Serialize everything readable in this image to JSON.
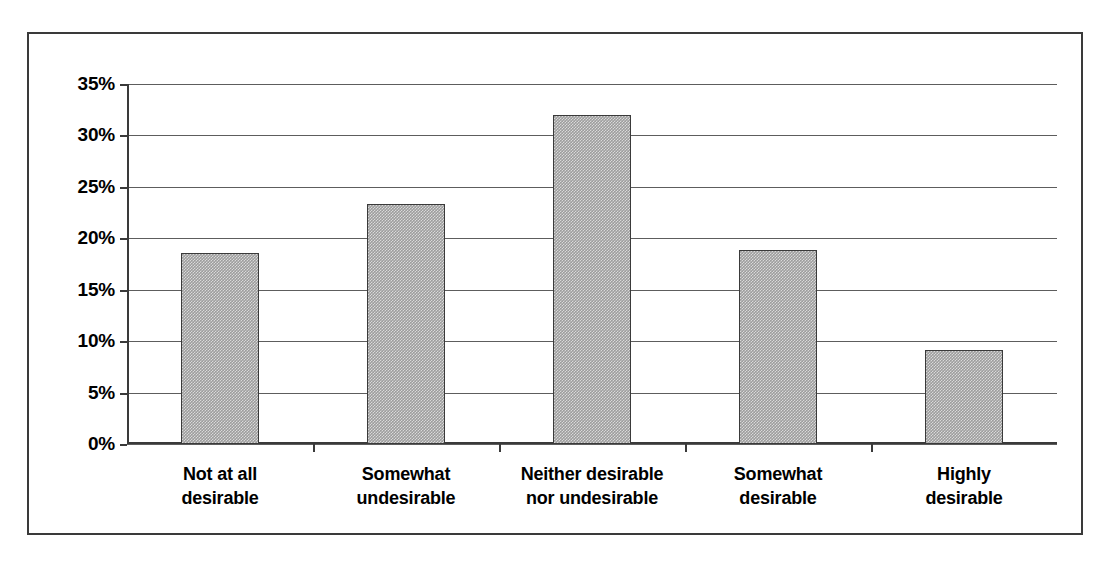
{
  "chart_data": {
    "type": "bar",
    "title": "",
    "subtitle": "",
    "xlabel": "",
    "ylabel": "",
    "categories": [
      "Not at all\ndesirable",
      "Somewhat\nundesirable",
      "Neither desirable\nnor undesirable",
      "Somewhat\ndesirable",
      "Highly desirable"
    ],
    "values": [
      18.6,
      23.3,
      32.0,
      18.9,
      9.1
    ],
    "value_labels": [
      "18.6%",
      "23.3%",
      "32.0%",
      "18.9%",
      "9.1%"
    ],
    "ylim": [
      0,
      35
    ],
    "ytick_values": [
      0,
      5,
      10,
      15,
      20,
      25,
      30,
      35
    ],
    "ytick_labels": [
      "0%",
      "5%",
      "10%",
      "15%",
      "20%",
      "25%",
      "30%",
      "35%"
    ],
    "grid": "horizontal",
    "legend": "none",
    "bar_fill_color": "#9d9d9d",
    "bar_border_color": "#3a3a3a",
    "gridline_color": "#5d5d5d",
    "axis_color": "#3a3a3a",
    "background_color": "#ffffff",
    "frame_border_color": "#3a3a3a"
  }
}
